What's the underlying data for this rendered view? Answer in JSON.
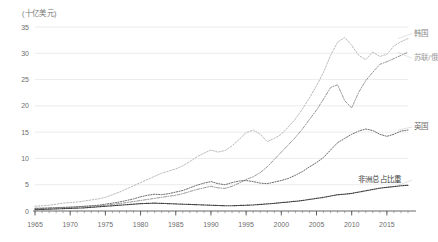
{
  "chart_data": {
    "type": "line",
    "title": "",
    "subtitle": "",
    "unit_label": "(十亿美元)",
    "xlabel": "",
    "ylabel": "",
    "xlim": [
      1965,
      2018
    ],
    "ylim": [
      0,
      35
    ],
    "grid": true,
    "grid_axis": "y",
    "legend_position": "inline-right",
    "yticks": [
      0,
      5,
      10,
      15,
      20,
      25,
      30,
      35
    ],
    "ytick_labels": [
      "0",
      "5",
      "10",
      "15",
      "20",
      "25",
      "30",
      "35"
    ],
    "xticks": [
      1965,
      1970,
      1975,
      1980,
      1985,
      1990,
      1995,
      2000,
      2005,
      2010,
      2015
    ],
    "xtick_labels": [
      "1965",
      "1970",
      "1975",
      "1980",
      "1985",
      "1990",
      "1995",
      "2000",
      "2005",
      "2010",
      "2015"
    ],
    "x": [
      1965,
      1966,
      1967,
      1968,
      1969,
      1970,
      1971,
      1972,
      1973,
      1974,
      1975,
      1976,
      1977,
      1978,
      1979,
      1980,
      1981,
      1982,
      1983,
      1984,
      1985,
      1986,
      1987,
      1988,
      1989,
      1990,
      1991,
      1992,
      1993,
      1994,
      1995,
      1996,
      1997,
      1998,
      1999,
      2000,
      2001,
      2002,
      2003,
      2004,
      2005,
      2006,
      2007,
      2008,
      2009,
      2010,
      2011,
      2012,
      2013,
      2014,
      2015,
      2016,
      2017,
      2018
    ],
    "series": [
      {
        "name": "韩国",
        "label": "韩国",
        "color": "#b9b9b9",
        "style": "dotted",
        "values": [
          0.9,
          1.0,
          1.1,
          1.3,
          1.5,
          1.6,
          1.7,
          1.9,
          2.1,
          2.3,
          2.6,
          3.1,
          3.6,
          4.2,
          4.8,
          5.4,
          6.0,
          6.6,
          7.2,
          7.6,
          8.0,
          8.6,
          9.4,
          10.3,
          11.0,
          11.6,
          11.2,
          11.5,
          12.4,
          13.6,
          14.9,
          15.4,
          14.6,
          13.2,
          13.8,
          14.6,
          16.0,
          17.5,
          19.4,
          21.5,
          23.8,
          26.4,
          29.6,
          32.1,
          33.0,
          31.5,
          29.6,
          28.8,
          30.2,
          29.4,
          29.8,
          31.4,
          32.2,
          32.8
        ]
      },
      {
        "name": "苏联/俄罗斯",
        "label": "苏联/俄",
        "color": "#9a9a9a",
        "style": "dash-dot",
        "values": [
          0.5,
          0.55,
          0.6,
          0.65,
          0.7,
          0.75,
          0.8,
          0.85,
          0.9,
          1.0,
          1.1,
          1.25,
          1.4,
          1.6,
          1.8,
          2.0,
          2.2,
          2.4,
          2.6,
          2.8,
          3.0,
          3.3,
          3.7,
          4.1,
          4.4,
          4.7,
          4.4,
          4.3,
          4.7,
          5.3,
          6.0,
          6.5,
          7.3,
          8.4,
          9.8,
          11.2,
          12.6,
          14.0,
          15.6,
          17.4,
          19.2,
          21.3,
          23.5,
          24.0,
          21.0,
          19.6,
          22.6,
          24.8,
          26.4,
          27.9,
          28.4,
          29.0,
          29.6,
          30.2
        ]
      },
      {
        "name": "英国",
        "label": "英国",
        "color": "#6d6d6d",
        "style": "dotted-fine",
        "values": [
          0.5,
          0.5,
          0.55,
          0.6,
          0.65,
          0.7,
          0.8,
          0.9,
          1.0,
          1.1,
          1.3,
          1.5,
          1.7,
          2.0,
          2.3,
          2.7,
          3.0,
          3.2,
          3.1,
          3.3,
          3.6,
          3.9,
          4.4,
          4.9,
          5.3,
          5.6,
          5.2,
          5.0,
          5.4,
          5.7,
          5.8,
          5.6,
          5.3,
          5.2,
          5.5,
          5.8,
          6.2,
          6.8,
          7.5,
          8.4,
          9.2,
          10.2,
          11.6,
          13.0,
          13.8,
          14.6,
          15.2,
          15.6,
          15.3,
          14.6,
          14.2,
          14.6,
          15.2,
          15.4
        ]
      },
      {
        "name": "非洲总占比重",
        "label": "非洲总占比重",
        "color": "#3d3d3d",
        "style": "dot-dense",
        "values": [
          0.25,
          0.3,
          0.35,
          0.4,
          0.45,
          0.5,
          0.55,
          0.6,
          0.7,
          0.8,
          0.9,
          1.0,
          1.1,
          1.2,
          1.3,
          1.4,
          1.45,
          1.5,
          1.45,
          1.4,
          1.35,
          1.3,
          1.25,
          1.2,
          1.15,
          1.1,
          1.05,
          1.0,
          1.0,
          1.05,
          1.1,
          1.15,
          1.25,
          1.35,
          1.45,
          1.6,
          1.7,
          1.85,
          2.0,
          2.2,
          2.4,
          2.6,
          2.85,
          3.1,
          3.2,
          3.35,
          3.6,
          3.85,
          4.1,
          4.35,
          4.5,
          4.65,
          4.8,
          4.9
        ]
      }
    ],
    "annotations": []
  },
  "axes": {
    "unit": "(十亿美元)"
  }
}
